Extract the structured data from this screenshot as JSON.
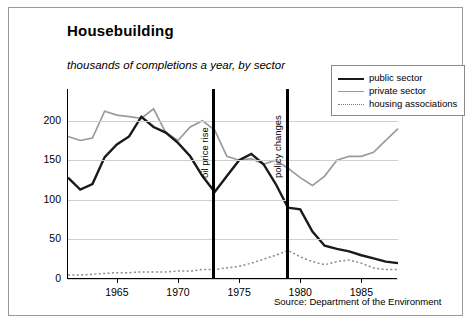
{
  "header": {
    "title": "Housebuilding",
    "subtitle": "thousands of completions a year, by sector",
    "source": "Source: Department of the Environment"
  },
  "legend": [
    {
      "label": "public sector",
      "color": "#1a1a1a",
      "style": "solid-thick"
    },
    {
      "label": "private sector",
      "color": "#9a9a9a",
      "style": "solid"
    },
    {
      "label": "housing associations",
      "color": "#8a8a8a",
      "style": "dotted"
    }
  ],
  "annotations": [
    {
      "label": "oil price rise",
      "x": 1973
    },
    {
      "label": "policy changes",
      "x": 1979
    }
  ],
  "chart_data": {
    "type": "line",
    "title": "Housebuilding",
    "subtitle": "thousands of completions a year, by sector",
    "xlabel": "",
    "ylabel": "thousands of completions a year",
    "xlim": [
      1961,
      1988
    ],
    "ylim": [
      0,
      240
    ],
    "yticks": [
      0,
      50,
      100,
      150,
      200
    ],
    "xticks": [
      1965,
      1970,
      1975,
      1980,
      1985
    ],
    "grid": true,
    "legend_position": "top-right",
    "source": "Source: Department of the Environment",
    "x": [
      1961,
      1962,
      1963,
      1964,
      1965,
      1966,
      1967,
      1968,
      1969,
      1970,
      1971,
      1972,
      1973,
      1974,
      1975,
      1976,
      1977,
      1978,
      1979,
      1980,
      1981,
      1982,
      1983,
      1984,
      1985,
      1986,
      1987,
      1988
    ],
    "series": [
      {
        "name": "public sector",
        "color": "#1a1a1a",
        "values": [
          128,
          113,
          120,
          154,
          170,
          180,
          205,
          192,
          185,
          172,
          155,
          130,
          110,
          130,
          150,
          158,
          145,
          120,
          90,
          88,
          60,
          42,
          38,
          35,
          30,
          26,
          22,
          20
        ]
      },
      {
        "name": "private sector",
        "color": "#9a9a9a",
        "values": [
          180,
          175,
          178,
          212,
          207,
          205,
          203,
          215,
          185,
          175,
          192,
          200,
          188,
          155,
          150,
          152,
          145,
          150,
          140,
          128,
          118,
          130,
          150,
          155,
          155,
          160,
          175,
          190
        ]
      },
      {
        "name": "housing associations",
        "color": "#8a8a8a",
        "values": [
          5,
          5,
          6,
          7,
          8,
          8,
          9,
          9,
          9,
          10,
          10,
          12,
          12,
          14,
          16,
          20,
          25,
          30,
          36,
          28,
          22,
          18,
          22,
          24,
          20,
          14,
          12,
          12
        ]
      }
    ]
  },
  "axis": {
    "y_labels": [
      "200",
      "150",
      "100",
      "50",
      "0"
    ],
    "x_labels": [
      "1965",
      "1970",
      "1975",
      "1980",
      "1985"
    ]
  }
}
